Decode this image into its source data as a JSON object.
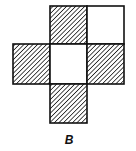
{
  "figure": {
    "label": "B",
    "cell_size": 37,
    "colors": {
      "stroke": "#111111",
      "hatch": "#222222",
      "empty": "#ffffff"
    },
    "cells": [
      {
        "id": "top-left",
        "col": 1,
        "row": 0,
        "shaded": true
      },
      {
        "id": "top-right",
        "col": 2,
        "row": 0,
        "shaded": false
      },
      {
        "id": "middle-left",
        "col": 0,
        "row": 1,
        "shaded": true
      },
      {
        "id": "middle-center",
        "col": 1,
        "row": 1,
        "shaded": false
      },
      {
        "id": "middle-right",
        "col": 2,
        "row": 1,
        "shaded": true
      },
      {
        "id": "bottom",
        "col": 1,
        "row": 2,
        "shaded": true
      }
    ]
  }
}
